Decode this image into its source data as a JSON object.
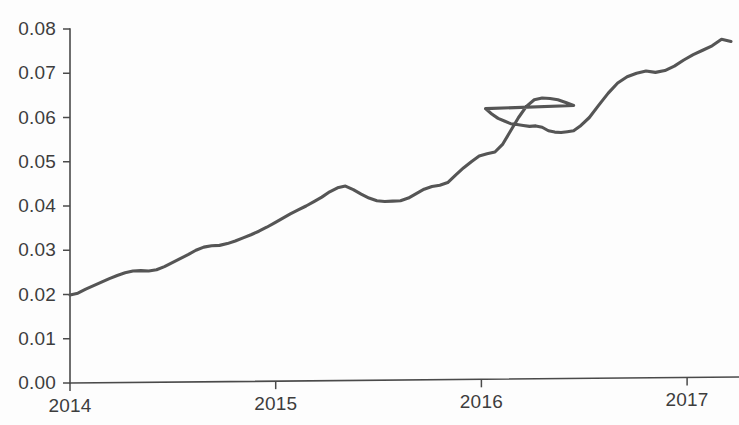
{
  "chart_data": {
    "type": "line",
    "title": "",
    "subtitle": "",
    "xlabel": "",
    "ylabel": "",
    "xlim": [
      2014.0,
      2017.2
    ],
    "ylim": [
      0.0,
      0.08
    ],
    "grid": false,
    "legend": null,
    "series_color": "#555555",
    "axis_color": "#4a4a4a",
    "background": "#fdfdfd",
    "y_ticks": [
      0.0,
      0.01,
      0.02,
      0.03,
      0.04,
      0.05,
      0.06,
      0.07,
      0.08
    ],
    "y_tick_labels": [
      "0.00",
      "0.01",
      "0.02",
      "0.03",
      "0.04",
      "0.05",
      "0.06",
      "0.07",
      "0.08"
    ],
    "x_ticks": [
      2014,
      2015,
      2016,
      2017
    ],
    "x_tick_labels": [
      "2014",
      "2015",
      "2016",
      "2017"
    ],
    "series": [
      {
        "name": "series-1",
        "color": "#555555",
        "x": [
          2014.0,
          2014.05,
          2014.1,
          2014.15,
          2014.2,
          2014.25,
          2014.3,
          2014.35,
          2014.4,
          2014.45,
          2014.5,
          2014.55,
          2014.6,
          2014.65,
          2014.7,
          2014.75,
          2014.8,
          2014.85,
          2014.9,
          2014.95,
          2015.0,
          2015.05,
          2015.1,
          2015.15,
          2015.2,
          2015.25,
          2015.3,
          2015.35,
          2015.4,
          2015.45,
          2015.5,
          2015.55,
          2015.6,
          2015.65,
          2015.7,
          2015.75,
          2015.8,
          2015.85,
          2015.9,
          2015.95,
          2016.0,
          2016.05,
          2016.1,
          2016.15,
          2016.2,
          2016.25,
          2016.3,
          2016.35,
          2016.4,
          2016.45,
          2016.5,
          2016.55,
          2016.6,
          2016.65,
          2016.7,
          2016.75,
          2016.8,
          2016.85,
          2016.9,
          2016.95,
          2017.0,
          2017.05,
          2017.1,
          2017.15,
          2017.2
        ],
        "y": [
          0.0199,
          0.0203,
          0.0212,
          0.022,
          0.0228,
          0.0236,
          0.0243,
          0.0249,
          0.0253,
          0.0254,
          0.0253,
          0.0256,
          0.0263,
          0.0272,
          0.0281,
          0.029,
          0.03,
          0.0307,
          0.031,
          0.0311,
          0.0315,
          0.0321,
          0.0328,
          0.0335,
          0.0343,
          0.0352,
          0.0362,
          0.0372,
          0.0382,
          0.0391,
          0.04,
          0.041,
          0.042,
          0.0432,
          0.0441,
          0.0445,
          0.0437,
          0.0427,
          0.0418,
          0.0412,
          0.041,
          0.0411,
          0.0412,
          0.0418,
          0.0428,
          0.0438,
          0.0444,
          0.0447,
          0.0453,
          0.047,
          0.0486,
          0.05,
          0.0513,
          0.0518,
          0.0522,
          0.054,
          0.057,
          0.06,
          0.0625,
          0.064,
          0.0644,
          0.0643,
          0.064,
          0.0634,
          0.0627
        ]
      }
    ],
    "series_tail": {
      "x": [
        2016.6,
        2016.64,
        2016.68,
        2016.72,
        2016.76,
        2016.8,
        2016.84,
        2016.88,
        2016.92,
        2016.96,
        2017.0,
        2017.04,
        2017.08,
        2017.12,
        2017.16,
        2017.2
      ],
      "y": [
        0.0627,
        0.062,
        0.0608,
        0.0598,
        0.0592,
        0.0586,
        0.0584,
        0.0582,
        0.058,
        0.0581,
        0.0578,
        0.057,
        0.0567,
        0.0566,
        0.0568,
        0.057
      ]
    },
    "annotations": [],
    "notes": {
      "start_value": "0.0199",
      "end_value": "0.0775",
      "local_peak_2015": "0.0445",
      "local_trough_2015": "0.0409",
      "peak_2016": "0.0644",
      "trough_late_2016": "0.0565",
      "max_value": "0.0777"
    }
  },
  "figure": {
    "plot_left_px": 70,
    "plot_baseline_px": 383,
    "px_per_year": 205.7,
    "px_per_unit": 4425
  }
}
